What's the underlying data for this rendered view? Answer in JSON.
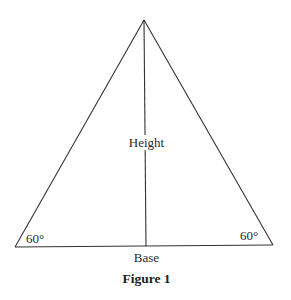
{
  "figure": {
    "caption": "Figure 1",
    "shape": "equilateral triangle",
    "labels": {
      "height": "Height",
      "base": "Base",
      "angle_left": "60°",
      "angle_right": "60°"
    },
    "geometry": {
      "apex": [
        144,
        20
      ],
      "bottom_left": [
        15,
        247
      ],
      "bottom_right": [
        273,
        245
      ],
      "height_foot": [
        146,
        246
      ]
    },
    "colors": {
      "stroke": "#333333",
      "background": "#ffffff"
    }
  }
}
